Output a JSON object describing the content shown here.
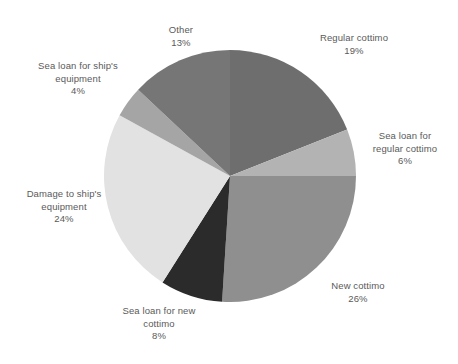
{
  "chart_data": {
    "type": "pie",
    "title": "",
    "subtitle": "",
    "xlabel": "",
    "ylabel": "",
    "grid": false,
    "legend_position": "none",
    "label_format": "name + percent",
    "start_angle_deg": 0,
    "direction": "clockwise",
    "units": "percent",
    "categories": [
      "Regular cottimo",
      "Sea loan for regular cottimo",
      "New cottimo",
      "Sea loan for new cottimo",
      "Damage to ship's equipment",
      "Sea loan for ship's equipment",
      "Other"
    ],
    "values": [
      19,
      6,
      26,
      8,
      24,
      4,
      13
    ],
    "colors": [
      "#6e6e6e",
      "#b3b3b3",
      "#8f8f8f",
      "#2b2b2b",
      "#e2e2e2",
      "#a5a5a5",
      "#767676"
    ],
    "slices": [
      {
        "name": "Regular cottimo",
        "value": 19,
        "value_label": "19%",
        "color": "#6e6e6e",
        "start_deg": 0,
        "end_deg": 68.4
      },
      {
        "name": "Sea loan for regular cottimo",
        "name_line1": "Sea loan for",
        "name_line2": "regular cottimo",
        "value": 6,
        "value_label": "6%",
        "color": "#b3b3b3",
        "start_deg": 68.4,
        "end_deg": 90.0
      },
      {
        "name": "New cottimo",
        "value": 26,
        "value_label": "26%",
        "color": "#8f8f8f",
        "start_deg": 90.0,
        "end_deg": 183.6
      },
      {
        "name": "Sea loan for new cottimo",
        "name_line1": "Sea loan for new",
        "name_line2": "cottimo",
        "value": 8,
        "value_label": "8%",
        "color": "#2b2b2b",
        "start_deg": 183.6,
        "end_deg": 212.4
      },
      {
        "name": "Damage to ship's equipment",
        "name_line1": "Damage to ship's",
        "name_line2": "equipment",
        "value": 24,
        "value_label": "24%",
        "color": "#e2e2e2",
        "start_deg": 212.4,
        "end_deg": 298.8
      },
      {
        "name": "Sea loan for ship's equipment",
        "name_line1": "Sea loan for ship's",
        "name_line2": "equipment",
        "value": 4,
        "value_label": "4%",
        "color": "#a5a5a5",
        "start_deg": 298.8,
        "end_deg": 313.2
      },
      {
        "name": "Other",
        "value": 13,
        "value_label": "13%",
        "color": "#767676",
        "start_deg": 313.2,
        "end_deg": 360.0
      }
    ]
  },
  "labels": {
    "regular_cottimo": {
      "name": "Regular cottimo",
      "value": "19%"
    },
    "sea_loan_regular_cottimo": {
      "line1": "Sea loan for",
      "line2": "regular cottimo",
      "value": "6%"
    },
    "new_cottimo": {
      "name": "New cottimo",
      "value": "26%"
    },
    "sea_loan_new_cottimo": {
      "line1": "Sea loan for new",
      "line2": "cottimo",
      "value": "8%"
    },
    "damage_ships_equipment": {
      "line1": "Damage to ship's",
      "line2": "equipment",
      "value": "24%"
    },
    "sea_loan_ships_equipment": {
      "line1": "Sea loan for ship's",
      "line2": "equipment",
      "value": "4%"
    },
    "other": {
      "name": "Other",
      "value": "13%"
    }
  },
  "style": {
    "background": "#ffffff",
    "label_color": "#5a5a5a"
  }
}
